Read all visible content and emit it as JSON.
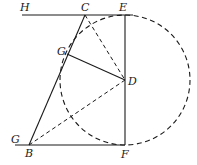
{
  "diagram": {
    "title": "",
    "stroke_color": "#1a1a1a",
    "points": {
      "H": {
        "label": "H",
        "x": 22,
        "y": 15
      },
      "C": {
        "label": "C",
        "x": 85,
        "y": 15
      },
      "E": {
        "label": "E",
        "x": 125,
        "y": 15
      },
      "G_top": {
        "label": "G",
        "x": 67,
        "y": 54
      },
      "D": {
        "label": "D",
        "x": 125,
        "y": 80
      },
      "G_bottom": {
        "label": "G",
        "x": 15,
        "y": 145
      },
      "B": {
        "label": "B",
        "x": 29,
        "y": 145
      },
      "F": {
        "label": "F",
        "x": 125,
        "y": 145
      }
    },
    "solid_segments": [
      [
        "H",
        "E"
      ],
      [
        "G_bottom",
        "F"
      ],
      [
        "C",
        "B"
      ],
      [
        "G_top",
        "D"
      ],
      [
        "E",
        "F"
      ]
    ],
    "dashed_segments": [
      [
        "C",
        "D"
      ],
      [
        "B",
        "D"
      ]
    ],
    "circle": {
      "center": "D",
      "radius": 65,
      "style": "dashed"
    }
  }
}
